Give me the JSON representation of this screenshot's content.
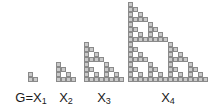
{
  "figure": {
    "background_color": "#ffffff",
    "cell_fill_color": "#c9c9c9",
    "cell_border_color": "#8a8a8a",
    "label_color": "#1a1a1a",
    "cell_size_px": 5,
    "baseline_y_px": 82
  },
  "shapes": [
    {
      "id": "x1",
      "label_prefix": "G=X",
      "label_subscript": "1",
      "label_full": "G=X₁",
      "order": 1,
      "grid_size": 2,
      "cell_count": 3,
      "left_px": 28,
      "label_left_px": 2,
      "label_width_px": 58
    },
    {
      "id": "x2",
      "label_prefix": "X",
      "label_subscript": "2",
      "label_full": "X₂",
      "order": 2,
      "grid_size": 4,
      "cell_count": 9,
      "left_px": 56,
      "label_left_px": 56,
      "label_width_px": 20
    },
    {
      "id": "x3",
      "label_prefix": "X",
      "label_subscript": "3",
      "label_full": "X₃",
      "order": 3,
      "grid_size": 8,
      "cell_count": 27,
      "left_px": 84,
      "label_left_px": 94,
      "label_width_px": 20
    },
    {
      "id": "x4",
      "label_prefix": "X",
      "label_subscript": "4",
      "label_full": "X₄",
      "order": 4,
      "grid_size": 16,
      "cell_count": 81,
      "left_px": 128,
      "label_left_px": 158,
      "label_width_px": 20
    }
  ],
  "chart_data": {
    "type": "diagram",
    "categories": [
      "G=X₁",
      "X₂",
      "X₃",
      "X₄"
    ],
    "grid_sizes": [
      2,
      4,
      8,
      16
    ],
    "cell_counts": [
      3,
      9,
      27,
      81
    ],
    "rule": "cell (row r from bottom, column c from left) is filled when (r AND c) == 0 in binary",
    "xlabel": "",
    "ylabel": "",
    "legend": []
  }
}
